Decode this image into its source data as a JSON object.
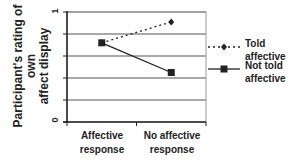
{
  "chart_data": {
    "type": "line",
    "title": "",
    "xlabel": "",
    "ylabel": "Participant's rating of own affect display",
    "ylabel_lines": [
      "Participant's rating of own",
      "affect display"
    ],
    "categories": [
      "Affective response",
      "No affective response"
    ],
    "category_lines": [
      [
        "Affective",
        "response"
      ],
      [
        "No affective",
        "response"
      ]
    ],
    "ylim": [
      0,
      1
    ],
    "ytick_labels": [
      "0",
      "1"
    ],
    "grid": true,
    "gridline_step": 0.2,
    "legend_position": "right",
    "series": [
      {
        "name": "Told affective",
        "name_lines": [
          "Told",
          "affective"
        ],
        "values": [
          0.72,
          0.91
        ],
        "line_style": "dotted",
        "marker": "diamond",
        "color": "#222222"
      },
      {
        "name": "Not told affective",
        "name_lines": [
          "Not told",
          "affective"
        ],
        "values": [
          0.72,
          0.45
        ],
        "line_style": "solid",
        "marker": "square",
        "color": "#222222"
      }
    ]
  }
}
